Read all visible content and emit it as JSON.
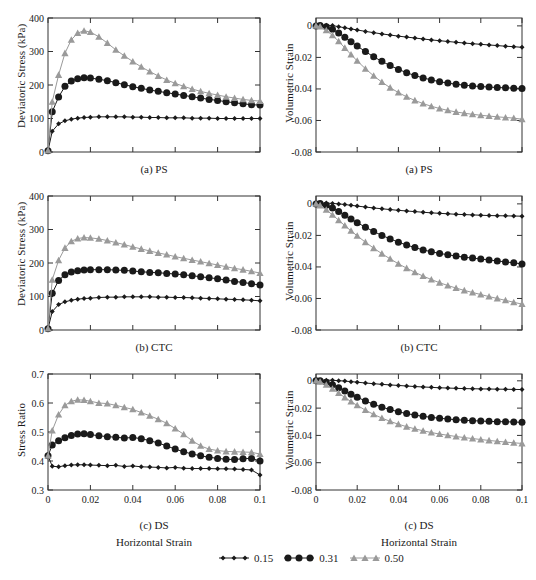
{
  "figure": {
    "xlabel": "Horizontal Strain",
    "legend_title": "",
    "panels_order": [
      "a-left",
      "a-right",
      "b-left",
      "b-right",
      "c-left",
      "c-right"
    ]
  },
  "legend": {
    "entries": [
      {
        "label": "0.15",
        "marker": "diamond",
        "color": "#1a1a1a",
        "size": "small"
      },
      {
        "label": "0.31",
        "marker": "circle",
        "color": "#1a1a1a",
        "size": "large"
      },
      {
        "label": "0.50",
        "marker": "triangle",
        "color": "#9a9a9a",
        "size": "medium"
      }
    ]
  },
  "chart_data": [
    {
      "id": "a-left",
      "type": "line",
      "title": "(a) PS",
      "xlabel": "",
      "ylabel": "Deviatoric Stress (kPa)",
      "xlim": [
        0,
        0.1
      ],
      "ylim": [
        0,
        400
      ],
      "xticks": [
        0,
        0.02,
        0.04,
        0.06,
        0.08,
        0.1
      ],
      "xticklabels": [
        "0",
        "0.02",
        "0.04",
        "0.06",
        "0.08",
        "0.1"
      ],
      "yticks": [
        0,
        100,
        200,
        300,
        400
      ],
      "yticklabels": [
        "0",
        "100",
        "200",
        "300",
        "400"
      ],
      "show_xticklabels": false,
      "grid": false,
      "x": [
        0,
        0.002,
        0.005,
        0.008,
        0.011,
        0.014,
        0.017,
        0.02,
        0.024,
        0.028,
        0.032,
        0.036,
        0.04,
        0.044,
        0.048,
        0.052,
        0.056,
        0.06,
        0.064,
        0.068,
        0.072,
        0.076,
        0.08,
        0.084,
        0.088,
        0.092,
        0.096,
        0.1
      ],
      "series": [
        {
          "name": "0.15",
          "marker": "diamond",
          "color": "#1a1a1a",
          "values": [
            4,
            62,
            84,
            93,
            98,
            101,
            103,
            104,
            105,
            105,
            105,
            105,
            104,
            104,
            103,
            103,
            102,
            102,
            102,
            101,
            101,
            101,
            100,
            100,
            100,
            100,
            100,
            100
          ]
        },
        {
          "name": "0.31",
          "marker": "circle",
          "color": "#1a1a1a",
          "values": [
            4,
            120,
            164,
            196,
            212,
            219,
            222,
            221,
            217,
            213,
            207,
            201,
            195,
            190,
            185,
            181,
            177,
            173,
            169,
            165,
            161,
            157,
            154,
            150,
            147,
            144,
            141,
            140
          ]
        },
        {
          "name": "0.50",
          "marker": "triangle",
          "color": "#9a9a9a",
          "values": [
            4,
            150,
            230,
            295,
            335,
            355,
            362,
            358,
            344,
            325,
            305,
            287,
            270,
            254,
            240,
            227,
            215,
            205,
            196,
            188,
            181,
            175,
            170,
            165,
            161,
            157,
            154,
            152
          ]
        }
      ]
    },
    {
      "id": "a-right",
      "type": "line",
      "title": "(a) PS",
      "xlabel": "",
      "ylabel": "Volumetric Strain",
      "xlim": [
        0,
        0.1
      ],
      "ylim": [
        -0.08,
        0.005
      ],
      "xticks": [
        0,
        0.02,
        0.04,
        0.06,
        0.08,
        0.1
      ],
      "xticklabels": [
        "0",
        "0.02",
        "0.04",
        "0.06",
        "0.08",
        "0.1"
      ],
      "yticks": [
        0,
        -0.02,
        -0.04,
        -0.06,
        -0.08
      ],
      "yticklabels": [
        "0",
        "-0.02",
        "-0.04",
        "-0.06",
        "-0.08"
      ],
      "show_xticklabels": false,
      "grid": false,
      "x": [
        0,
        0.002,
        0.005,
        0.008,
        0.011,
        0.014,
        0.017,
        0.02,
        0.024,
        0.028,
        0.032,
        0.036,
        0.04,
        0.044,
        0.048,
        0.052,
        0.056,
        0.06,
        0.064,
        0.068,
        0.072,
        0.076,
        0.08,
        0.084,
        0.088,
        0.092,
        0.096,
        0.1
      ],
      "series": [
        {
          "name": "0.15",
          "marker": "diamond",
          "color": "#1a1a1a",
          "values": [
            0,
            0.0003,
            0.0004,
            0.0002,
            -0.0005,
            -0.0012,
            -0.0019,
            -0.0026,
            -0.0035,
            -0.0043,
            -0.0051,
            -0.0058,
            -0.0065,
            -0.0071,
            -0.0077,
            -0.0083,
            -0.0089,
            -0.0094,
            -0.0099,
            -0.0104,
            -0.0109,
            -0.0113,
            -0.0117,
            -0.0121,
            -0.0125,
            -0.0129,
            -0.0132,
            -0.0136
          ]
        },
        {
          "name": "0.31",
          "marker": "circle",
          "color": "#1a1a1a",
          "values": [
            0,
            0.0002,
            -0.0006,
            -0.0022,
            -0.0045,
            -0.0072,
            -0.01,
            -0.0128,
            -0.0163,
            -0.0196,
            -0.0225,
            -0.0252,
            -0.0276,
            -0.0297,
            -0.0315,
            -0.033,
            -0.0343,
            -0.0354,
            -0.0363,
            -0.037,
            -0.0376,
            -0.0381,
            -0.0385,
            -0.0388,
            -0.0391,
            -0.0393,
            -0.0395,
            -0.0397
          ]
        },
        {
          "name": "0.50",
          "marker": "triangle",
          "color": "#9a9a9a",
          "values": [
            0,
            -0.0005,
            -0.0028,
            -0.006,
            -0.0098,
            -0.014,
            -0.0182,
            -0.0222,
            -0.0272,
            -0.0317,
            -0.0357,
            -0.0392,
            -0.0423,
            -0.045,
            -0.0473,
            -0.0493,
            -0.051,
            -0.0524,
            -0.0536,
            -0.0546,
            -0.0554,
            -0.0561,
            -0.0567,
            -0.0572,
            -0.0577,
            -0.0581,
            -0.0585,
            -0.0592
          ]
        }
      ]
    },
    {
      "id": "b-left",
      "type": "line",
      "title": "(b) CTC",
      "xlabel": "",
      "ylabel": "Deviatoric Stress (kPa)",
      "xlim": [
        0,
        0.1
      ],
      "ylim": [
        0,
        400
      ],
      "xticks": [
        0,
        0.02,
        0.04,
        0.06,
        0.08,
        0.1
      ],
      "xticklabels": [
        "0",
        "0.02",
        "0.04",
        "0.06",
        "0.08",
        "0.1"
      ],
      "yticks": [
        0,
        100,
        200,
        300,
        400
      ],
      "yticklabels": [
        "0",
        "100",
        "200",
        "300",
        "400"
      ],
      "show_xticklabels": false,
      "grid": false,
      "x": [
        0,
        0.002,
        0.005,
        0.008,
        0.011,
        0.014,
        0.017,
        0.02,
        0.024,
        0.028,
        0.032,
        0.036,
        0.04,
        0.044,
        0.048,
        0.052,
        0.056,
        0.06,
        0.064,
        0.068,
        0.072,
        0.076,
        0.08,
        0.084,
        0.088,
        0.092,
        0.096,
        0.1
      ],
      "series": [
        {
          "name": "0.15",
          "marker": "diamond",
          "color": "#1a1a1a",
          "values": [
            4,
            55,
            76,
            84,
            89,
            92,
            94,
            95,
            97,
            98,
            98,
            99,
            99,
            99,
            99,
            98,
            98,
            97,
            97,
            96,
            95,
            94,
            93,
            92,
            91,
            90,
            89,
            87
          ]
        },
        {
          "name": "0.31",
          "marker": "circle",
          "color": "#1a1a1a",
          "values": [
            4,
            110,
            148,
            165,
            173,
            177,
            179,
            180,
            180,
            180,
            179,
            178,
            176,
            174,
            172,
            171,
            169,
            167,
            165,
            162,
            159,
            156,
            153,
            149,
            145,
            142,
            138,
            134
          ]
        },
        {
          "name": "0.50",
          "marker": "triangle",
          "color": "#9a9a9a",
          "values": [
            4,
            150,
            208,
            245,
            265,
            273,
            276,
            275,
            272,
            267,
            261,
            255,
            248,
            242,
            236,
            230,
            225,
            219,
            214,
            209,
            204,
            199,
            194,
            189,
            184,
            180,
            175,
            170
          ]
        }
      ]
    },
    {
      "id": "b-right",
      "type": "line",
      "title": "(b) CTC",
      "xlabel": "",
      "ylabel": "Volumetric Strain",
      "xlim": [
        0,
        0.1
      ],
      "ylim": [
        -0.08,
        0.005
      ],
      "xticks": [
        0,
        0.02,
        0.04,
        0.06,
        0.08,
        0.1
      ],
      "xticklabels": [
        "0",
        "0.02",
        "0.04",
        "0.06",
        "0.08",
        "0.1"
      ],
      "yticks": [
        0,
        -0.02,
        -0.04,
        -0.06,
        -0.08
      ],
      "yticklabels": [
        "0",
        "-0.02",
        "-0.04",
        "-0.06",
        "-0.08"
      ],
      "show_xticklabels": false,
      "grid": false,
      "x": [
        0,
        0.002,
        0.005,
        0.008,
        0.011,
        0.014,
        0.017,
        0.02,
        0.024,
        0.028,
        0.032,
        0.036,
        0.04,
        0.044,
        0.048,
        0.052,
        0.056,
        0.06,
        0.064,
        0.068,
        0.072,
        0.076,
        0.08,
        0.084,
        0.088,
        0.092,
        0.096,
        0.1
      ],
      "series": [
        {
          "name": "0.15",
          "marker": "diamond",
          "color": "#1a1a1a",
          "values": [
            0,
            0.0004,
            0.0005,
            0.0003,
            0.0,
            -0.0004,
            -0.0009,
            -0.0014,
            -0.002,
            -0.0026,
            -0.0031,
            -0.0036,
            -0.0041,
            -0.0045,
            -0.0049,
            -0.0053,
            -0.0057,
            -0.006,
            -0.0063,
            -0.0066,
            -0.0068,
            -0.007,
            -0.0072,
            -0.0074,
            -0.0075,
            -0.0076,
            -0.0077,
            -0.0078
          ]
        },
        {
          "name": "0.31",
          "marker": "circle",
          "color": "#1a1a1a",
          "values": [
            0,
            0.0002,
            -0.0008,
            -0.0026,
            -0.0048,
            -0.0072,
            -0.0096,
            -0.0119,
            -0.0148,
            -0.0175,
            -0.02,
            -0.0222,
            -0.0243,
            -0.0261,
            -0.0277,
            -0.0292,
            -0.0304,
            -0.0314,
            -0.0323,
            -0.0331,
            -0.0338,
            -0.0344,
            -0.035,
            -0.0356,
            -0.0362,
            -0.0368,
            -0.0374,
            -0.0381
          ]
        },
        {
          "name": "0.50",
          "marker": "triangle",
          "color": "#9a9a9a",
          "values": [
            0,
            -0.001,
            -0.0038,
            -0.007,
            -0.0104,
            -0.0138,
            -0.0171,
            -0.0203,
            -0.0243,
            -0.0281,
            -0.0316,
            -0.0349,
            -0.038,
            -0.0408,
            -0.0434,
            -0.0458,
            -0.048,
            -0.05,
            -0.0518,
            -0.0534,
            -0.0549,
            -0.0562,
            -0.0575,
            -0.0588,
            -0.06,
            -0.0612,
            -0.0624,
            -0.0636
          ]
        }
      ]
    },
    {
      "id": "c-left",
      "type": "line",
      "title": "(c) DS",
      "xlabel": "Horizontal Strain",
      "ylabel": "Stress Ratio",
      "xlim": [
        0,
        0.1
      ],
      "ylim": [
        0.3,
        0.7
      ],
      "xticks": [
        0,
        0.02,
        0.04,
        0.06,
        0.08,
        0.1
      ],
      "xticklabels": [
        "0",
        "0.02",
        "0.04",
        "0.06",
        "0.08",
        "0.1"
      ],
      "yticks": [
        0.3,
        0.4,
        0.5,
        0.6,
        0.7
      ],
      "yticklabels": [
        "0.3",
        "0.4",
        "0.5",
        "0.6",
        "0.7"
      ],
      "show_xticklabels": true,
      "grid": false,
      "x": [
        0,
        0.002,
        0.005,
        0.008,
        0.011,
        0.014,
        0.017,
        0.02,
        0.024,
        0.028,
        0.032,
        0.036,
        0.04,
        0.044,
        0.048,
        0.052,
        0.056,
        0.06,
        0.064,
        0.068,
        0.072,
        0.076,
        0.08,
        0.084,
        0.088,
        0.092,
        0.096,
        0.1
      ],
      "series": [
        {
          "name": "0.15",
          "marker": "diamond",
          "color": "#1a1a1a",
          "values": [
            0.418,
            0.382,
            0.38,
            0.384,
            0.386,
            0.387,
            0.387,
            0.386,
            0.385,
            0.384,
            0.385,
            0.381,
            0.383,
            0.38,
            0.379,
            0.378,
            0.376,
            0.378,
            0.375,
            0.374,
            0.374,
            0.374,
            0.373,
            0.373,
            0.372,
            0.371,
            0.369,
            0.352
          ]
        },
        {
          "name": "0.31",
          "marker": "circle",
          "color": "#1a1a1a",
          "values": [
            0.418,
            0.455,
            0.47,
            0.48,
            0.488,
            0.493,
            0.494,
            0.491,
            0.487,
            0.484,
            0.482,
            0.479,
            0.481,
            0.477,
            0.47,
            0.462,
            0.452,
            0.441,
            0.432,
            0.424,
            0.418,
            0.413,
            0.409,
            0.406,
            0.405,
            0.408,
            0.409,
            0.4
          ]
        },
        {
          "name": "0.50",
          "marker": "triangle",
          "color": "#9a9a9a",
          "values": [
            0.418,
            0.505,
            0.56,
            0.592,
            0.606,
            0.611,
            0.61,
            0.606,
            0.6,
            0.598,
            0.592,
            0.585,
            0.578,
            0.567,
            0.556,
            0.544,
            0.53,
            0.512,
            0.492,
            0.47,
            0.452,
            0.441,
            0.436,
            0.433,
            0.432,
            0.431,
            0.43,
            0.424
          ]
        }
      ]
    },
    {
      "id": "c-right",
      "type": "line",
      "title": "(c) DS",
      "xlabel": "Horizontal Strain",
      "ylabel": "Volumetric Strain",
      "xlim": [
        0,
        0.1
      ],
      "ylim": [
        -0.08,
        0.005
      ],
      "xticks": [
        0,
        0.02,
        0.04,
        0.06,
        0.08,
        0.1
      ],
      "xticklabels": [
        "0",
        "0.02",
        "0.04",
        "0.06",
        "0.08",
        "0.1"
      ],
      "yticks": [
        0,
        -0.02,
        -0.04,
        -0.06,
        -0.08
      ],
      "yticklabels": [
        "0",
        "-0.02",
        "-0.04",
        "-0.06",
        "-0.08"
      ],
      "show_xticklabels": true,
      "grid": false,
      "x": [
        0,
        0.002,
        0.005,
        0.008,
        0.011,
        0.014,
        0.017,
        0.02,
        0.024,
        0.028,
        0.032,
        0.036,
        0.04,
        0.044,
        0.048,
        0.052,
        0.056,
        0.06,
        0.064,
        0.068,
        0.072,
        0.076,
        0.08,
        0.084,
        0.088,
        0.092,
        0.096,
        0.1
      ],
      "series": [
        {
          "name": "0.15",
          "marker": "diamond",
          "color": "#1a1a1a",
          "values": [
            0,
            0.0004,
            0.0005,
            0.0004,
            0.0001,
            -0.0002,
            -0.0006,
            -0.001,
            -0.0016,
            -0.0021,
            -0.0026,
            -0.003,
            -0.0034,
            -0.0038,
            -0.0042,
            -0.0045,
            -0.0048,
            -0.0051,
            -0.0053,
            -0.0055,
            -0.0057,
            -0.0058,
            -0.0059,
            -0.006,
            -0.0061,
            -0.0062,
            -0.0063,
            -0.0064
          ]
        },
        {
          "name": "0.31",
          "marker": "circle",
          "color": "#1a1a1a",
          "values": [
            0,
            0.0001,
            -0.001,
            -0.0028,
            -0.005,
            -0.0074,
            -0.0098,
            -0.012,
            -0.0148,
            -0.0172,
            -0.0193,
            -0.0211,
            -0.0227,
            -0.024,
            -0.0251,
            -0.026,
            -0.0268,
            -0.0274,
            -0.028,
            -0.0285,
            -0.0289,
            -0.0292,
            -0.0295,
            -0.0297,
            -0.0299,
            -0.03,
            -0.0302,
            -0.0304
          ]
        },
        {
          "name": "0.50",
          "marker": "triangle",
          "color": "#9a9a9a",
          "values": [
            0,
            -0.0008,
            -0.003,
            -0.0058,
            -0.009,
            -0.0122,
            -0.0152,
            -0.018,
            -0.0215,
            -0.0246,
            -0.0273,
            -0.0297,
            -0.0318,
            -0.0336,
            -0.0352,
            -0.0366,
            -0.0379,
            -0.039,
            -0.0399,
            -0.0408,
            -0.0416,
            -0.0423,
            -0.043,
            -0.0437,
            -0.0443,
            -0.0449,
            -0.0454,
            -0.0459
          ]
        }
      ]
    }
  ]
}
